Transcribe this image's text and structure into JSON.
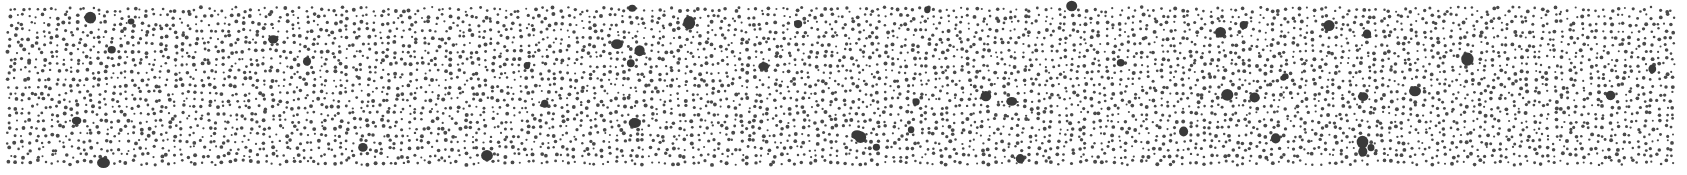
{
  "image": {
    "width": 1687,
    "height": 175,
    "background": "#ffffff",
    "description": "Stippled dot texture: dense field of small dark grey dots with scattered larger blobs"
  },
  "texture": {
    "dot_color": "#4a4a4a",
    "blob_color": "#3a3a3a",
    "area": {
      "x0": 6,
      "y0": 6,
      "x1": 1676,
      "y1": 166
    },
    "small_dot_count": 5600,
    "small_dot_radius": [
      1.0,
      2.0
    ],
    "large_blob_count": 48,
    "large_blob_radius": [
      3.0,
      6.5
    ],
    "seed": 1337
  }
}
